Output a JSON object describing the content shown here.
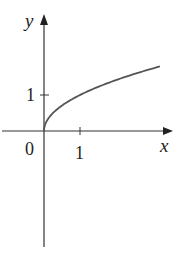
{
  "chart_data": {
    "type": "line",
    "title": "",
    "function": "y = sqrt(x)",
    "xlabel": "x",
    "ylabel": "y",
    "origin_label": "0",
    "x_ticks": [
      {
        "value": 1,
        "label": "1"
      }
    ],
    "y_ticks": [
      {
        "value": 1,
        "label": "1"
      }
    ],
    "xlim": [
      -1.2,
      3.6
    ],
    "ylim": [
      -3.2,
      3.2
    ],
    "grid": false,
    "legend": null,
    "series": [
      {
        "name": "sqrt(x)",
        "color": "#555555",
        "x": [
          0,
          0.05,
          0.1,
          0.25,
          0.5,
          0.75,
          1,
          1.5,
          2,
          2.5,
          3,
          3.22
        ],
        "y": [
          0,
          0.224,
          0.316,
          0.5,
          0.707,
          0.866,
          1,
          1.225,
          1.414,
          1.581,
          1.732,
          1.794
        ]
      }
    ]
  },
  "colors": {
    "axis": "#333333",
    "curve": "#555555"
  }
}
